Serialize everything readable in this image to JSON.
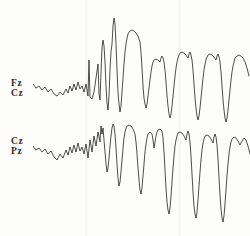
{
  "figure": {
    "background_color": "#fdfdfc",
    "trace_color": "#2e2e2e",
    "width": 250,
    "height": 236
  },
  "channels": [
    {
      "id": "fz-cz",
      "label_line1": "Fz",
      "label_line2": "Cz",
      "baseline_y": 88
    },
    {
      "id": "cz-pz",
      "label_line1": "Cz",
      "label_line2": "Pz",
      "baseline_y": 150
    }
  ],
  "chart_data": {
    "type": "line",
    "xlabel": "",
    "ylabel": "",
    "grid": false,
    "legend": "none",
    "xlim": [
      0,
      250
    ],
    "ylim": [
      0,
      236
    ],
    "y_inverted": true,
    "series": [
      {
        "name": "Fz-Cz",
        "label_line1": "Fz",
        "label_line2": "Cz",
        "baseline": 88,
        "color": "#2e2e2e",
        "points": [
          [
            36,
            88
          ],
          [
            39,
            86
          ],
          [
            42,
            90
          ],
          [
            45,
            87
          ],
          [
            48,
            92
          ],
          [
            51,
            89
          ],
          [
            54,
            94
          ],
          [
            57,
            96
          ],
          [
            60,
            92
          ],
          [
            63,
            95
          ],
          [
            66,
            89
          ],
          [
            68,
            93
          ],
          [
            70,
            86
          ],
          [
            72,
            91
          ],
          [
            74,
            84
          ],
          [
            76,
            90
          ],
          [
            78,
            82
          ],
          [
            80,
            89
          ],
          [
            82,
            86
          ],
          [
            84,
            92
          ],
          [
            86,
            84
          ],
          [
            88,
            96
          ],
          [
            89,
            60
          ],
          [
            90,
            97
          ],
          [
            92,
            99
          ],
          [
            94,
            92
          ],
          [
            96,
            78
          ],
          [
            98,
            64
          ],
          [
            99,
            94
          ],
          [
            100,
            100
          ],
          [
            101,
            72
          ],
          [
            102,
            48
          ],
          [
            103,
            40
          ],
          [
            104,
            46
          ],
          [
            105,
            62
          ],
          [
            106,
            86
          ],
          [
            107,
            103
          ],
          [
            108,
            110
          ],
          [
            109,
            96
          ],
          [
            110,
            70
          ],
          [
            111,
            52
          ],
          [
            112,
            44
          ],
          [
            113,
            26
          ],
          [
            114,
            18
          ],
          [
            115,
            24
          ],
          [
            116,
            44
          ],
          [
            117,
            70
          ],
          [
            118,
            92
          ],
          [
            119,
            104
          ],
          [
            120,
            112
          ],
          [
            121,
            106
          ],
          [
            122,
            92
          ],
          [
            123,
            78
          ],
          [
            124,
            64
          ],
          [
            125,
            52
          ],
          [
            126,
            44
          ],
          [
            127,
            38
          ],
          [
            128,
            34
          ],
          [
            129,
            32
          ],
          [
            130,
            31
          ],
          [
            132,
            30
          ],
          [
            134,
            31
          ],
          [
            136,
            33
          ],
          [
            138,
            36
          ],
          [
            140,
            42
          ],
          [
            141,
            52
          ],
          [
            142,
            68
          ],
          [
            143,
            86
          ],
          [
            144,
            98
          ],
          [
            145,
            104
          ],
          [
            146,
            108
          ],
          [
            147,
            104
          ],
          [
            148,
            96
          ],
          [
            149,
            88
          ],
          [
            150,
            80
          ],
          [
            151,
            72
          ],
          [
            152,
            66
          ],
          [
            153,
            62
          ],
          [
            154,
            60
          ],
          [
            156,
            59
          ],
          [
            158,
            60
          ],
          [
            160,
            62
          ],
          [
            161,
            58
          ],
          [
            162,
            56
          ],
          [
            163,
            58
          ],
          [
            164,
            62
          ],
          [
            165,
            70
          ],
          [
            166,
            82
          ],
          [
            167,
            96
          ],
          [
            168,
            106
          ],
          [
            169,
            114
          ],
          [
            170,
            118
          ],
          [
            171,
            114
          ],
          [
            172,
            106
          ],
          [
            173,
            96
          ],
          [
            174,
            86
          ],
          [
            175,
            76
          ],
          [
            176,
            68
          ],
          [
            177,
            62
          ],
          [
            178,
            58
          ],
          [
            179,
            55
          ],
          [
            180,
            53
          ],
          [
            182,
            52
          ],
          [
            184,
            53
          ],
          [
            186,
            55
          ],
          [
            188,
            58
          ],
          [
            189,
            54
          ],
          [
            190,
            52
          ],
          [
            191,
            55
          ],
          [
            192,
            60
          ],
          [
            193,
            70
          ],
          [
            194,
            84
          ],
          [
            195,
            98
          ],
          [
            196,
            108
          ],
          [
            197,
            116
          ],
          [
            198,
            120
          ],
          [
            199,
            116
          ],
          [
            200,
            108
          ],
          [
            201,
            98
          ],
          [
            202,
            88
          ],
          [
            203,
            78
          ],
          [
            204,
            70
          ],
          [
            205,
            64
          ],
          [
            206,
            60
          ],
          [
            207,
            57
          ],
          [
            208,
            55
          ],
          [
            210,
            54
          ],
          [
            212,
            55
          ],
          [
            214,
            57
          ],
          [
            216,
            60
          ],
          [
            217,
            56
          ],
          [
            218,
            54
          ],
          [
            219,
            57
          ],
          [
            220,
            62
          ],
          [
            221,
            72
          ],
          [
            222,
            86
          ],
          [
            223,
            100
          ],
          [
            224,
            110
          ],
          [
            225,
            118
          ],
          [
            226,
            122
          ],
          [
            227,
            118
          ],
          [
            228,
            110
          ],
          [
            229,
            100
          ],
          [
            230,
            90
          ],
          [
            231,
            80
          ],
          [
            232,
            72
          ],
          [
            233,
            66
          ],
          [
            234,
            62
          ],
          [
            235,
            58
          ],
          [
            237,
            56
          ],
          [
            239,
            55
          ],
          [
            241,
            56
          ],
          [
            243,
            58
          ],
          [
            245,
            62
          ],
          [
            247,
            68
          ],
          [
            249,
            76
          ]
        ]
      },
      {
        "name": "Cz-Pz",
        "label_line1": "Cz",
        "label_line2": "Pz",
        "baseline": 150,
        "color": "#2e2e2e",
        "points": [
          [
            36,
            150
          ],
          [
            39,
            148
          ],
          [
            42,
            152
          ],
          [
            45,
            149
          ],
          [
            48,
            154
          ],
          [
            51,
            151
          ],
          [
            54,
            157
          ],
          [
            57,
            160
          ],
          [
            60,
            154
          ],
          [
            63,
            158
          ],
          [
            66,
            150
          ],
          [
            68,
            155
          ],
          [
            70,
            147
          ],
          [
            72,
            153
          ],
          [
            74,
            145
          ],
          [
            76,
            152
          ],
          [
            78,
            143
          ],
          [
            80,
            151
          ],
          [
            82,
            147
          ],
          [
            84,
            154
          ],
          [
            86,
            144
          ],
          [
            88,
            158
          ],
          [
            90,
            140
          ],
          [
            92,
            152
          ],
          [
            94,
            136
          ],
          [
            96,
            146
          ],
          [
            98,
            132
          ],
          [
            100,
            142
          ],
          [
            101,
            126
          ],
          [
            102,
            134
          ],
          [
            103,
            128
          ],
          [
            104,
            140
          ],
          [
            105,
            152
          ],
          [
            106,
            164
          ],
          [
            107,
            172
          ],
          [
            108,
            168
          ],
          [
            109,
            158
          ],
          [
            110,
            146
          ],
          [
            111,
            136
          ],
          [
            112,
            128
          ],
          [
            113,
            124
          ],
          [
            114,
            126
          ],
          [
            115,
            134
          ],
          [
            116,
            148
          ],
          [
            117,
            164
          ],
          [
            118,
            178
          ],
          [
            119,
            186
          ],
          [
            120,
            182
          ],
          [
            121,
            172
          ],
          [
            122,
            160
          ],
          [
            123,
            148
          ],
          [
            124,
            138
          ],
          [
            125,
            132
          ],
          [
            126,
            128
          ],
          [
            127,
            126
          ],
          [
            129,
            125
          ],
          [
            131,
            126
          ],
          [
            133,
            129
          ],
          [
            135,
            134
          ],
          [
            136,
            142
          ],
          [
            137,
            154
          ],
          [
            138,
            168
          ],
          [
            139,
            180
          ],
          [
            140,
            190
          ],
          [
            141,
            194
          ],
          [
            142,
            188
          ],
          [
            143,
            176
          ],
          [
            144,
            164
          ],
          [
            145,
            152
          ],
          [
            146,
            144
          ],
          [
            147,
            138
          ],
          [
            148,
            134
          ],
          [
            150,
            132
          ],
          [
            152,
            134
          ],
          [
            153,
            140
          ],
          [
            154,
            148
          ],
          [
            155,
            142
          ],
          [
            156,
            136
          ],
          [
            157,
            132
          ],
          [
            158,
            130
          ],
          [
            160,
            129
          ],
          [
            162,
            131
          ],
          [
            163,
            138
          ],
          [
            164,
            152
          ],
          [
            165,
            170
          ],
          [
            166,
            188
          ],
          [
            167,
            202
          ],
          [
            168,
            210
          ],
          [
            169,
            214
          ],
          [
            170,
            208
          ],
          [
            171,
            196
          ],
          [
            172,
            182
          ],
          [
            173,
            168
          ],
          [
            174,
            156
          ],
          [
            175,
            146
          ],
          [
            176,
            140
          ],
          [
            177,
            136
          ],
          [
            178,
            133
          ],
          [
            180,
            132
          ],
          [
            182,
            133
          ],
          [
            184,
            136
          ],
          [
            186,
            140
          ],
          [
            187,
            134
          ],
          [
            188,
            131
          ],
          [
            189,
            134
          ],
          [
            190,
            142
          ],
          [
            191,
            156
          ],
          [
            192,
            174
          ],
          [
            193,
            192
          ],
          [
            194,
            206
          ],
          [
            195,
            214
          ],
          [
            196,
            218
          ],
          [
            197,
            212
          ],
          [
            198,
            200
          ],
          [
            199,
            186
          ],
          [
            200,
            172
          ],
          [
            201,
            160
          ],
          [
            202,
            150
          ],
          [
            203,
            143
          ],
          [
            204,
            139
          ],
          [
            205,
            136
          ],
          [
            207,
            135
          ],
          [
            209,
            136
          ],
          [
            211,
            139
          ],
          [
            213,
            143
          ],
          [
            214,
            137
          ],
          [
            215,
            134
          ],
          [
            216,
            137
          ],
          [
            217,
            145
          ],
          [
            218,
            159
          ],
          [
            219,
            177
          ],
          [
            220,
            195
          ],
          [
            221,
            209
          ],
          [
            222,
            218
          ],
          [
            223,
            222
          ],
          [
            224,
            216
          ],
          [
            225,
            204
          ],
          [
            226,
            190
          ],
          [
            227,
            176
          ],
          [
            228,
            164
          ],
          [
            229,
            154
          ],
          [
            230,
            147
          ],
          [
            231,
            142
          ],
          [
            232,
            139
          ],
          [
            234,
            137
          ],
          [
            236,
            138
          ],
          [
            238,
            141
          ],
          [
            240,
            145
          ],
          [
            242,
            141
          ],
          [
            244,
            138
          ],
          [
            246,
            140
          ],
          [
            248,
            146
          ],
          [
            250,
            154
          ]
        ]
      }
    ]
  }
}
